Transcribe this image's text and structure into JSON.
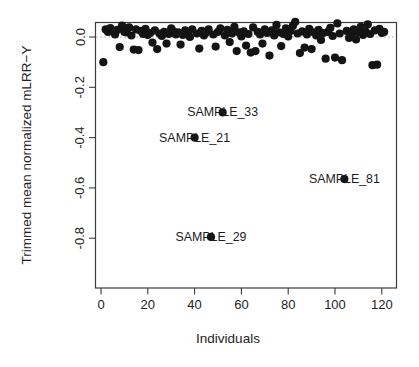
{
  "chart_data": {
    "type": "scatter",
    "title": "",
    "xlabel": "Individuals",
    "ylabel": "Trimmed mean normalized mLRR−Y",
    "xlim": [
      -2,
      124
    ],
    "ylim": [
      -0.88,
      0.09
    ],
    "xticks": [
      0,
      20,
      40,
      60,
      80,
      100,
      120
    ],
    "xticklabels": [
      "0",
      "20",
      "40",
      "60",
      "80",
      "100",
      "120"
    ],
    "yticks": [
      0.0,
      -0.2,
      -0.4,
      -0.6,
      -0.8
    ],
    "yticklabels": [
      "0.0",
      "-0.2",
      "-0.4",
      "-0.6",
      "-0.8"
    ],
    "grid": false,
    "legend": null,
    "reference_line": {
      "y": 0.0,
      "style": "dashed",
      "color": "#b0b0b0"
    },
    "marker": {
      "shape": "circle",
      "color": "#141414",
      "size": 4.1
    },
    "series": [
      {
        "name": "individuals",
        "x": [
          1,
          2,
          3,
          4,
          5,
          6,
          7,
          8,
          9,
          10,
          11,
          12,
          13,
          14,
          15,
          16,
          17,
          18,
          19,
          20,
          21,
          22,
          23,
          24,
          25,
          26,
          27,
          28,
          29,
          30,
          31,
          32,
          33,
          34,
          35,
          36,
          37,
          38,
          39,
          40,
          41,
          42,
          43,
          44,
          45,
          46,
          47,
          48,
          49,
          50,
          51,
          52,
          53,
          54,
          55,
          56,
          57,
          58,
          59,
          60,
          61,
          62,
          63,
          64,
          65,
          66,
          67,
          68,
          69,
          70,
          71,
          72,
          73,
          74,
          75,
          76,
          77,
          78,
          79,
          80,
          81,
          82,
          83,
          84,
          85,
          86,
          87,
          88,
          89,
          90,
          91,
          92,
          93,
          94,
          95,
          96,
          97,
          98,
          99,
          100,
          101,
          102,
          103,
          104,
          105,
          106,
          107,
          108,
          109,
          110,
          111,
          112,
          113,
          114,
          115,
          116,
          117,
          118,
          119,
          120,
          121
        ],
        "y": [
          -0.1,
          0.03,
          0.02,
          0.035,
          0.022,
          0.01,
          0.028,
          -0.04,
          0.045,
          0.02,
          0.018,
          0.038,
          0.006,
          -0.05,
          0.03,
          -0.052,
          0.024,
          0.012,
          0.032,
          0.008,
          0.016,
          -0.022,
          0.026,
          -0.048,
          0.014,
          0.004,
          0.02,
          -0.026,
          0.012,
          0.034,
          0.022,
          0.01,
          0.018,
          -0.03,
          0.008,
          0.026,
          0.016,
          0.0,
          0.03,
          -0.4,
          0.014,
          -0.046,
          0.024,
          0.006,
          0.018,
          0.03,
          -0.795,
          0.01,
          -0.038,
          0.02,
          0.034,
          -0.3,
          0.006,
          0.028,
          -0.02,
          0.014,
          0.04,
          -0.056,
          0.018,
          0.002,
          0.022,
          -0.034,
          0.012,
          -0.062,
          0.038,
          -0.056,
          0.02,
          0.01,
          -0.026,
          0.03,
          0.016,
          -0.074,
          0.026,
          0.006,
          0.048,
          0.018,
          -0.036,
          0.012,
          0.034,
          0.002,
          0.024,
          0.044,
          0.06,
          0.014,
          -0.064,
          0.022,
          -0.042,
          0.01,
          0.032,
          -0.048,
          0.018,
          0.006,
          0.028,
          -0.012,
          0.016,
          -0.086,
          0.02,
          0.036,
          0.004,
          -0.082,
          0.054,
          0.014,
          -0.092,
          -0.565,
          0.024,
          -0.004,
          0.01,
          0.03,
          -0.01,
          0.018,
          0.04,
          0.008,
          0.022,
          0.05,
          0.012,
          -0.112,
          0.026,
          -0.11,
          0.032,
          0.016,
          0.02
        ],
        "labeled_points": [
          {
            "label": "SAMPLE_33",
            "x": 52,
            "y": -0.3
          },
          {
            "label": "SAMPLE_21",
            "x": 40,
            "y": -0.4
          },
          {
            "label": "SAMPLE_81",
            "x": 104,
            "y": -0.565
          },
          {
            "label": "SAMPLE_29",
            "x": 47,
            "y": -0.795
          }
        ]
      }
    ]
  },
  "labels": {
    "sample_33": "SAMPLE_33",
    "sample_21": "SAMPLE_21",
    "sample_81": "SAMPLE_81",
    "sample_29": "SAMPLE_29"
  },
  "axes": {
    "x_title": "Individuals",
    "y_title": "Trimmed mean normalized mLRR−Y",
    "x_tick_0": "0",
    "x_tick_1": "20",
    "x_tick_2": "40",
    "x_tick_3": "60",
    "x_tick_4": "80",
    "x_tick_5": "100",
    "x_tick_6": "120",
    "y_tick_0": "0.0",
    "y_tick_1": "-0.2",
    "y_tick_2": "-0.4",
    "y_tick_3": "-0.6",
    "y_tick_4": "-0.8"
  },
  "colors": {
    "marker": "#141414",
    "axis": "#3c3c3c",
    "text": "#232323",
    "reference": "#b0b0b0",
    "background": "#ffffff"
  }
}
